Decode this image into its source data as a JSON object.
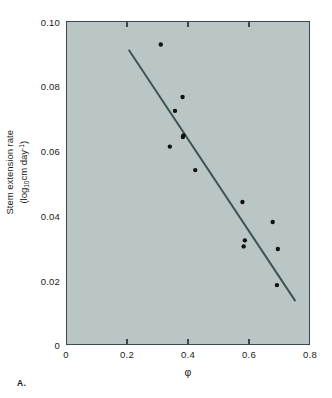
{
  "panel": {
    "label": "A."
  },
  "chart_data": {
    "type": "scatter",
    "title": "",
    "xlabel": "φ",
    "ylabel_line1": "Stem extension rate",
    "ylabel_line2_pre": "(log",
    "ylabel_line2_sub": "10",
    "ylabel_line2_mid": "cm day",
    "ylabel_line2_sup": "-1",
    "ylabel_line2_post": ")",
    "ylabel_plain": "Stem extension rate (log10cm day-1)",
    "xlim": [
      0,
      0.8
    ],
    "ylim": [
      0,
      0.1
    ],
    "xticks": [
      0,
      0.2,
      0.4,
      0.6,
      0.8
    ],
    "xticklabels": [
      "0",
      "0.2",
      "0.4",
      "0.6",
      "0.8"
    ],
    "yticks": [
      0,
      0.02,
      0.04,
      0.06,
      0.08,
      0.1
    ],
    "yticklabels": [
      "0",
      "0.02",
      "0.04",
      "0.06",
      "0.08",
      "0.10"
    ],
    "grid": false,
    "legend": null,
    "plot_bgcolor": "#b9c6c5",
    "axis_color": "#3a4a4a",
    "marker_color": "#111111",
    "marker_size": 4.4,
    "points": [
      {
        "x": 0.31,
        "y": 0.093
      },
      {
        "x": 0.382,
        "y": 0.0767
      },
      {
        "x": 0.357,
        "y": 0.0724
      },
      {
        "x": 0.385,
        "y": 0.0648
      },
      {
        "x": 0.383,
        "y": 0.0643
      },
      {
        "x": 0.34,
        "y": 0.0613
      },
      {
        "x": 0.424,
        "y": 0.054
      },
      {
        "x": 0.58,
        "y": 0.0441
      },
      {
        "x": 0.68,
        "y": 0.0379
      },
      {
        "x": 0.588,
        "y": 0.0322
      },
      {
        "x": 0.584,
        "y": 0.0303
      },
      {
        "x": 0.697,
        "y": 0.0295
      },
      {
        "x": 0.694,
        "y": 0.0183
      }
    ],
    "fit_line": {
      "type": "linear-regression",
      "color": "#3f5452",
      "width": 2.0,
      "x_start": 0.204,
      "y_start": 0.0914,
      "x_end": 0.755,
      "y_end": 0.0133
    }
  }
}
